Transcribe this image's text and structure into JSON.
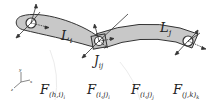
{
  "diagram": {
    "links": [
      {
        "id": "L_i",
        "label": "L",
        "sub": "i"
      },
      {
        "id": "L_j",
        "label": "L",
        "sub": "j"
      }
    ],
    "joint": {
      "label": "J",
      "sub": "ij"
    },
    "forces": [
      {
        "label": "F",
        "sub": "(h,i)",
        "subsub": "i"
      },
      {
        "label": "F",
        "sub": "(i,j)",
        "subsub": "i"
      },
      {
        "label": "F",
        "sub": "(i,j)",
        "subsub": "j"
      },
      {
        "label": "F",
        "sub": "(j,k)",
        "subsub": "k"
      }
    ],
    "axes": {
      "x": "x",
      "y": "y",
      "z": "z"
    },
    "colors": {
      "link_fill": "#c8c8c8",
      "stroke": "#333333",
      "bg": "#ffffff"
    }
  }
}
